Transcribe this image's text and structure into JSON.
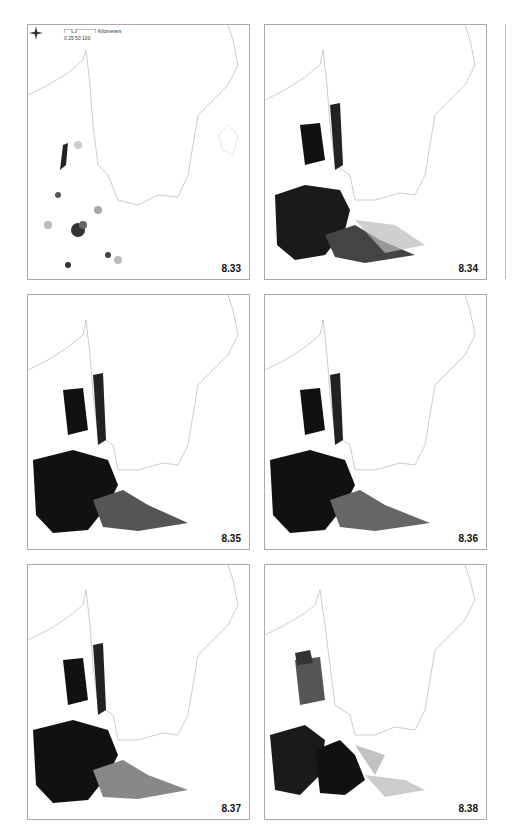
{
  "page": {
    "number": ""
  },
  "figure": {
    "scale_bar": {
      "ticks": "0  25 50     100",
      "unit": "Kilometers"
    },
    "compass": {
      "label": "N"
    },
    "panels": [
      {
        "label": "8.33",
        "intensity": "low"
      },
      {
        "label": "8.34",
        "intensity": "high"
      },
      {
        "label": "8.35",
        "intensity": "high"
      },
      {
        "label": "8.36",
        "intensity": "high"
      },
      {
        "label": "8.37",
        "intensity": "high"
      },
      {
        "label": "8.38",
        "intensity": "medium"
      }
    ]
  },
  "colors": {
    "dark": "#111111",
    "mid": "#777777",
    "light": "#cccccc",
    "coast": "#999999"
  }
}
